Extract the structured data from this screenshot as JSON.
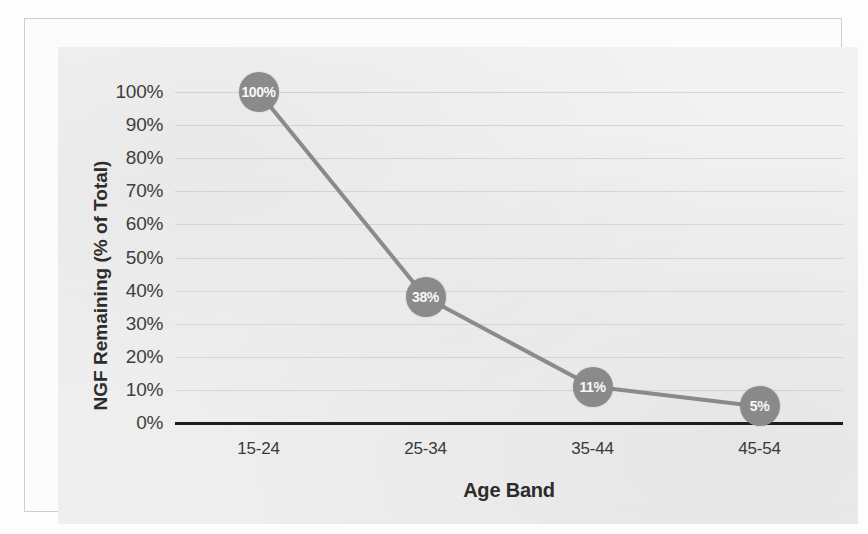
{
  "chart_data": {
    "type": "line",
    "title": "",
    "xlabel": "Age Band",
    "ylabel": "NGF Remaining (% of Total)",
    "categories": [
      "15-24",
      "25-34",
      "35-44",
      "45-54"
    ],
    "values": [
      100,
      38,
      11,
      5
    ],
    "point_labels": [
      "100%",
      "38%",
      "11%",
      "5%"
    ],
    "ytick_labels": [
      "100%",
      "90%",
      "80%",
      "70%",
      "60%",
      "50%",
      "40%",
      "30%",
      "20%",
      "10%",
      "0%"
    ],
    "ytick_values": [
      100,
      90,
      80,
      70,
      60,
      50,
      40,
      30,
      20,
      10,
      0
    ],
    "ylim": [
      0,
      100
    ],
    "grid": true,
    "legend": "none",
    "series": [
      {
        "name": "NGF Remaining",
        "values": [
          100,
          38,
          11,
          5
        ]
      }
    ]
  },
  "style": {
    "series_color": "#8e8e8e",
    "marker_color": "#8e8e8e",
    "marker_text_color": "#ffffff",
    "gridline_color": "#d8d8d8",
    "baseline_color": "#1d1d1d",
    "plot_background": "#f0f0f0",
    "frame_color": "#cfcfcf",
    "tick_text_color": "#404040",
    "axis_title_color": "#2d2d2d"
  }
}
